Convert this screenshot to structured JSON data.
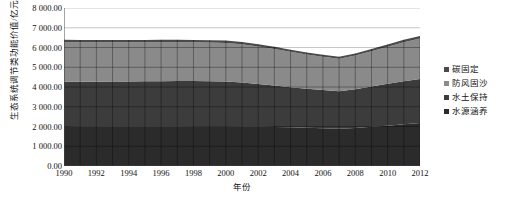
{
  "chart_data": {
    "type": "area",
    "stacked": true,
    "title": "",
    "xlabel": "年份",
    "ylabel": "生态系统调节类功能价值/亿元",
    "x": [
      1990,
      1991,
      1992,
      1993,
      1994,
      1995,
      1996,
      1997,
      1998,
      1999,
      2000,
      2001,
      2002,
      2003,
      2004,
      2005,
      2006,
      2007,
      2008,
      2009,
      2010,
      2011,
      2012
    ],
    "xtick_labels": [
      "1990",
      "1992",
      "1994",
      "1996",
      "1998",
      "2000",
      "2002",
      "2004",
      "2006",
      "2008",
      "2010",
      "2012"
    ],
    "xtick_values": [
      1990,
      1992,
      1994,
      1996,
      1998,
      2000,
      2002,
      2004,
      2006,
      2008,
      2010,
      2012
    ],
    "ytick_labels": [
      "0.00",
      "1 000.00",
      "2 000.00",
      "3 000.00",
      "4 000.00",
      "5 000.00",
      "6 000.00",
      "7 000.00",
      "8 000.00"
    ],
    "ytick_values": [
      0,
      1000,
      2000,
      3000,
      4000,
      5000,
      6000,
      7000,
      8000
    ],
    "ylim": [
      0,
      8000
    ],
    "xlim": [
      1990,
      2012
    ],
    "grid": true,
    "legend_position": "right",
    "series": [
      {
        "name": "水源涵养",
        "color": "#2b2b2b",
        "order": 1,
        "values": [
          1980,
          1985,
          1990,
          1995,
          1998,
          2000,
          2002,
          2005,
          2008,
          2010,
          2012,
          2005,
          1995,
          1980,
          1960,
          1940,
          1915,
          1890,
          1930,
          1985,
          2040,
          2110,
          2180
        ]
      },
      {
        "name": "水土保持",
        "color": "#3c3c3c",
        "order": 2,
        "values": [
          2290,
          2285,
          2280,
          2280,
          2285,
          2290,
          2295,
          2300,
          2295,
          2285,
          2270,
          2225,
          2160,
          2095,
          2030,
          1975,
          1935,
          1900,
          1960,
          2040,
          2120,
          2185,
          2230
        ]
      },
      {
        "name": "防风固沙",
        "color": "#8a8a8a",
        "order": 3,
        "values": [
          2000,
          1995,
          1990,
          1985,
          1980,
          1975,
          1970,
          1965,
          1960,
          1955,
          1950,
          1930,
          1895,
          1845,
          1790,
          1730,
          1680,
          1640,
          1700,
          1790,
          1880,
          1975,
          2050
        ]
      },
      {
        "name": "碳固定",
        "color": "#4a4a4a",
        "order": 4,
        "values": [
          120,
          120,
          120,
          120,
          120,
          120,
          120,
          120,
          120,
          120,
          120,
          118,
          115,
          112,
          110,
          108,
          106,
          105,
          108,
          112,
          116,
          120,
          122
        ]
      }
    ],
    "series_totals": [
      6390,
      6385,
      6380,
      6380,
      6383,
      6385,
      6387,
      6390,
      6383,
      6370,
      6352,
      6278,
      6165,
      6032,
      5890,
      5753,
      5636,
      5535,
      5698,
      5927,
      6156,
      6390,
      6582
    ]
  },
  "legend": {
    "items": [
      {
        "label": "碳固定",
        "color": "#4a4a4a",
        "marker": "square-marker"
      },
      {
        "label": "防风固沙",
        "color": "#8a8a8a",
        "marker": "square-marker"
      },
      {
        "label": "水土保持",
        "color": "#3c3c3c",
        "marker": "square-marker"
      },
      {
        "label": "水源涵养",
        "color": "#2b2b2b",
        "marker": "square-marker"
      }
    ]
  },
  "axes": {
    "y_title": "生态系统调节类功能价值/亿元",
    "x_title": "年份"
  }
}
